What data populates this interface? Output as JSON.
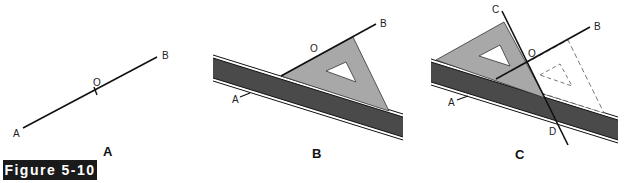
{
  "figure_label": "Figure 5-10",
  "panels": [
    {
      "id": "A",
      "caption": "A",
      "points": {
        "start": "A",
        "end": "B",
        "mid": "O"
      }
    },
    {
      "id": "B",
      "caption": "B",
      "points": {
        "start": "A",
        "end": "B",
        "mid": "O"
      }
    },
    {
      "id": "C",
      "caption": "C",
      "points": {
        "start": "A",
        "end": "B",
        "mid": "O",
        "perp_top": "C",
        "perp_bottom": "D"
      }
    }
  ],
  "colors": {
    "ruler": "#4a4a4a",
    "triangle": "#a8a8a8",
    "line": "#111111",
    "figure_box": "#1a1a1a"
  }
}
